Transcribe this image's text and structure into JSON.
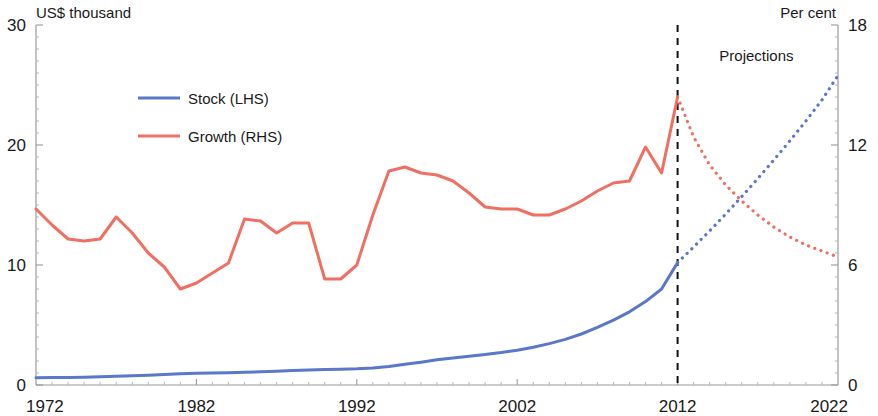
{
  "chart_data": {
    "type": "line",
    "title": "",
    "xlabel": "",
    "ylabel_left": "US$ thousand",
    "ylabel_right": "Per cent",
    "x": [
      1972,
      1973,
      1974,
      1975,
      1976,
      1977,
      1978,
      1979,
      1980,
      1981,
      1982,
      1983,
      1984,
      1985,
      1986,
      1987,
      1988,
      1989,
      1990,
      1991,
      1992,
      1993,
      1994,
      1995,
      1996,
      1997,
      1998,
      1999,
      2000,
      2001,
      2002,
      2003,
      2004,
      2005,
      2006,
      2007,
      2008,
      2009,
      2010,
      2011,
      2012,
      2013,
      2014,
      2015,
      2016,
      2017,
      2018,
      2019,
      2020,
      2021,
      2022
    ],
    "xlim": [
      1972,
      2022
    ],
    "xticks": [
      1972,
      1982,
      1992,
      2002,
      2012,
      2022
    ],
    "xticklabels": [
      "1972",
      "1982",
      "1992",
      "2002",
      "2012",
      "2022"
    ],
    "ylim_left": [
      0,
      30
    ],
    "yticks_left": [
      0,
      10,
      20,
      30
    ],
    "yticklabels_left": [
      "0",
      "10",
      "20",
      "30"
    ],
    "ylim_right": [
      0,
      18
    ],
    "yticks_right": [
      0,
      6,
      12,
      18
    ],
    "yticklabels_right": [
      "0",
      "6",
      "12",
      "18"
    ],
    "grid": false,
    "legend_position": "upper-left-inside",
    "projection_start": 2012,
    "annotations": [
      {
        "text": "Projections",
        "x": 2014.6,
        "y": 16.2,
        "axis": "right"
      }
    ],
    "series": [
      {
        "name": "Stock (LHS)",
        "label": "Stock (LHS)",
        "axis": "left",
        "color": "#5b78c8",
        "style": "solid",
        "values": [
          0.6,
          0.62,
          0.63,
          0.65,
          0.68,
          0.72,
          0.77,
          0.82,
          0.88,
          0.93,
          0.97,
          1.0,
          1.03,
          1.06,
          1.1,
          1.15,
          1.2,
          1.25,
          1.3,
          1.32,
          1.35,
          1.42,
          1.55,
          1.72,
          1.9,
          2.1,
          2.25,
          2.4,
          2.55,
          2.7,
          2.9,
          3.15,
          3.45,
          3.8,
          4.25,
          4.8,
          5.4,
          6.1,
          6.95,
          8.0,
          10.2,
          null,
          null,
          null,
          null,
          null,
          null,
          null,
          null,
          null,
          null
        ]
      },
      {
        "name": "Stock (LHS) projection",
        "label": "Stock (LHS)",
        "axis": "left",
        "color": "#5b78c8",
        "style": "dotted",
        "values": [
          null,
          null,
          null,
          null,
          null,
          null,
          null,
          null,
          null,
          null,
          null,
          null,
          null,
          null,
          null,
          null,
          null,
          null,
          null,
          null,
          null,
          null,
          null,
          null,
          null,
          null,
          null,
          null,
          null,
          null,
          null,
          null,
          null,
          null,
          null,
          null,
          null,
          null,
          null,
          null,
          10.2,
          11.5,
          12.85,
          14.25,
          15.7,
          17.2,
          18.75,
          20.35,
          22.0,
          23.75,
          25.8
        ]
      },
      {
        "name": "Growth (RHS)",
        "label": "Growth (RHS)",
        "axis": "right",
        "color": "#ef6f62",
        "style": "solid",
        "values": [
          8.8,
          8.0,
          7.3,
          7.2,
          7.3,
          8.4,
          7.6,
          6.6,
          5.9,
          4.8,
          5.1,
          5.6,
          6.1,
          8.3,
          8.2,
          7.6,
          8.1,
          8.1,
          5.3,
          5.3,
          6.0,
          8.5,
          10.7,
          10.9,
          10.6,
          10.5,
          10.2,
          9.6,
          8.9,
          8.8,
          8.8,
          8.5,
          8.5,
          8.8,
          9.2,
          9.7,
          10.1,
          10.2,
          11.9,
          10.6,
          14.4,
          null,
          null,
          null,
          null,
          null,
          null,
          null,
          null,
          null,
          null
        ]
      },
      {
        "name": "Growth (RHS) projection",
        "label": "Growth (RHS)",
        "axis": "right",
        "color": "#ef6f62",
        "style": "dotted",
        "values": [
          null,
          null,
          null,
          null,
          null,
          null,
          null,
          null,
          null,
          null,
          null,
          null,
          null,
          null,
          null,
          null,
          null,
          null,
          null,
          null,
          null,
          null,
          null,
          null,
          null,
          null,
          null,
          null,
          null,
          null,
          null,
          null,
          null,
          null,
          null,
          null,
          null,
          null,
          null,
          null,
          14.4,
          12.4,
          11.0,
          10.0,
          9.2,
          8.5,
          7.9,
          7.4,
          7.0,
          6.7,
          6.4
        ]
      }
    ],
    "legend": [
      {
        "label": "Stock (LHS)",
        "color": "#5b78c8"
      },
      {
        "label": "Growth (RHS)",
        "color": "#ef6f62"
      }
    ],
    "colors": {
      "stock": "#5b78c8",
      "growth": "#ef6f62",
      "axis": "#9a9a9a",
      "text": "#1a1a1a",
      "divider": "#111111",
      "background": "#ffffff"
    }
  }
}
